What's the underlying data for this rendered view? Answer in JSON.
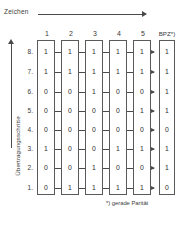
{
  "figure": {
    "top_axis_label": "Zeichen",
    "left_axis_label": "Übertragungsschritte",
    "footnote": "*) gerade Parität"
  },
  "chart_data": {
    "type": "table",
    "title": "Zeichen",
    "xlabel": "Zeichen",
    "ylabel": "Übertragungsschritte",
    "grid": false,
    "legend": null,
    "annotations": [
      "*) gerade Parität"
    ],
    "columns": [
      "1",
      "2",
      "3",
      "4",
      "5",
      "BPZ*)"
    ],
    "row_labels": [
      "8.",
      "7.",
      "6.",
      "5.",
      "4.",
      "3.",
      "2.",
      "1."
    ],
    "rows": [
      {
        "label": "8.",
        "values": [
          "1",
          "1",
          "1",
          "1",
          "1"
        ],
        "parity": "1"
      },
      {
        "label": "7.",
        "values": [
          "1",
          "1",
          "1",
          "1",
          "1"
        ],
        "parity": "1"
      },
      {
        "label": "6.",
        "values": [
          "0",
          "0",
          "1",
          "0",
          "0"
        ],
        "parity": "1"
      },
      {
        "label": "5.",
        "values": [
          "0",
          "0",
          "0",
          "0",
          "1"
        ],
        "parity": "1"
      },
      {
        "label": "4.",
        "values": [
          "0",
          "0",
          "0",
          "0",
          "0"
        ],
        "parity": "0"
      },
      {
        "label": "3.",
        "values": [
          "1",
          "0",
          "0",
          "1",
          "1"
        ],
        "parity": "1"
      },
      {
        "label": "2.",
        "values": [
          "0",
          "0",
          "1",
          "0",
          "0"
        ],
        "parity": "1"
      },
      {
        "label": "1.",
        "values": [
          "0",
          "1",
          "1",
          "1",
          "1"
        ],
        "parity": "0"
      }
    ]
  },
  "layout": {
    "col_x": [
      37,
      61,
      85,
      109,
      133,
      159
    ],
    "row_y": [
      48,
      68,
      88,
      107,
      126,
      145,
      164,
      184
    ]
  }
}
